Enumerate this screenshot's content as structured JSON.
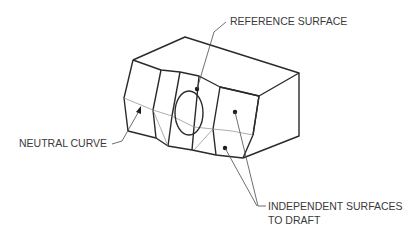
{
  "diagram": {
    "labels": {
      "reference_surface": "REFERENCE SURFACE",
      "neutral_curve": "NEUTRAL CURVE",
      "independent_surfaces_line1": "INDEPENDENT SURFACES",
      "independent_surfaces_line2": "TO DRAFT"
    },
    "colors": {
      "edge": "#2a2a2a",
      "text": "#3a3a3a",
      "background": "#ffffff"
    }
  }
}
